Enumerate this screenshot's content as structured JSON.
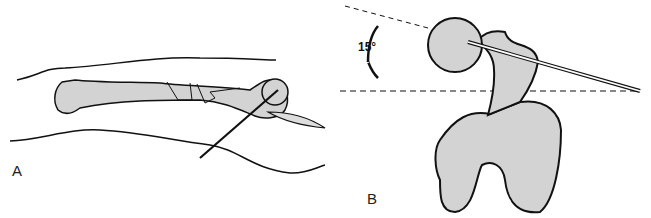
{
  "figure": {
    "panel_a": {
      "label": "A",
      "description": "Femur with comminuted shaft fracture, guide pin through proximal femur via incision"
    },
    "panel_b": {
      "label": "B",
      "description": "Distal view of femur showing 15 degree anteversion of femoral neck with guide pin"
    },
    "angle_label": "15°",
    "colors": {
      "bone": "#d3d3d3",
      "outline": "#111111",
      "background": "#ffffff"
    }
  }
}
